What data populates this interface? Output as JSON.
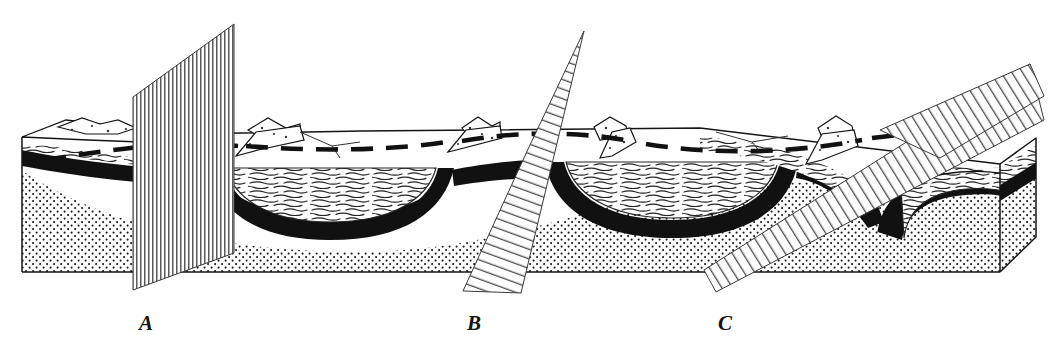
{
  "figure": {
    "domain_kind": "diagram",
    "background_color": "#ffffff",
    "ink_color": "#141414"
  },
  "labels": [
    {
      "id": "A",
      "text": "A",
      "x": 146,
      "y": 327,
      "describes": "vertical plane"
    },
    {
      "id": "B",
      "text": "B",
      "x": 474,
      "y": 327,
      "describes": "steeply inclined plane"
    },
    {
      "id": "C",
      "text": "C",
      "x": 725,
      "y": 327,
      "describes": "gently inclined plane"
    }
  ],
  "planes": [
    {
      "name": "plane-a-vertical",
      "label": "A",
      "hatch": "vertical",
      "hatch_spacing": 4.0,
      "stroke_color": "#333333",
      "corners": [
        [
          133,
          97
        ],
        [
          234,
          24
        ],
        [
          234,
          253
        ],
        [
          133,
          290
        ]
      ],
      "orientation": "vertical",
      "strike_note": "vertical plane cutting across the fold axis"
    },
    {
      "name": "plane-b-steep",
      "label": "B",
      "hatch": "inclined-steep",
      "hatch_spacing": 3.2,
      "stroke_color": "#333333",
      "corners": [
        [
          529,
          147
        ],
        [
          586,
          31
        ],
        [
          521,
          290
        ],
        [
          463,
          290
        ]
      ],
      "orientation": "steeply inclined",
      "strike_note": "steeply dipping plane"
    },
    {
      "name": "plane-c-gentle",
      "label": "C",
      "hatch": "inclined-gentle",
      "hatch_spacing": 3.4,
      "stroke_color": "#333333",
      "corners": [
        [
          1030,
          64
        ],
        [
          944,
          157
        ],
        [
          716,
          292
        ],
        [
          880,
          130
        ]
      ],
      "orientation": "gently inclined",
      "strike_note": "gently dipping plane"
    }
  ],
  "strata": [
    {
      "name": "upper-white-unit",
      "pattern": "blank",
      "fill": "#ffffff",
      "role": "youngest eroded cover"
    },
    {
      "name": "shale-unit",
      "pattern": "wavy-dash",
      "fill": "#ffffff",
      "role": "laminated shale in syncline cores"
    },
    {
      "name": "coal-seam",
      "pattern": "solid-black",
      "fill": "#111111",
      "role": "marker bed / coal seam"
    },
    {
      "name": "sandstone-unit",
      "pattern": "stipple-dots",
      "fill": "#ffffff",
      "role": "stippled sandstone"
    },
    {
      "name": "limestone-unit",
      "pattern": "brick",
      "fill": "#ffffff",
      "role": "brick-patterned limestone at base"
    }
  ],
  "structures": {
    "fold_axis_trace": {
      "name": "anticline-axis-dashed-trace",
      "style": "thick-dashed",
      "color": "#111111",
      "description": "dashed trace of the fold axis on the eroded top surface"
    },
    "synclines": [
      {
        "name": "syncline-1",
        "center_x": 330
      },
      {
        "name": "syncline-2",
        "center_x": 660
      },
      {
        "name": "syncline-3-plunging-nose",
        "center_x": 950
      }
    ],
    "ridges": [
      {
        "name": "hogback-ridge-1",
        "x": 80
      },
      {
        "name": "hogback-ridge-2",
        "x": 268
      },
      {
        "name": "hogback-ridge-3",
        "x": 475
      },
      {
        "name": "hogback-ridge-4",
        "x": 608
      },
      {
        "name": "hogback-ridge-5",
        "x": 832
      }
    ]
  },
  "block": {
    "name": "block-body",
    "top_surface_y": 137,
    "base_y": 272,
    "left_x": 22,
    "right_x": 1036,
    "right_end_corner": {
      "x": 1036,
      "y": 140
    }
  }
}
